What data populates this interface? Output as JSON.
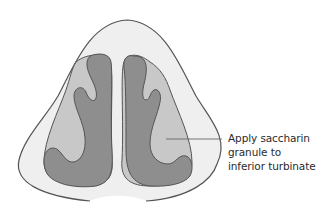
{
  "diagram": {
    "annotation": {
      "lines": [
        "Apply saccharin",
        "granule to",
        "inferior turbinate"
      ],
      "target": "inferior turbinate"
    },
    "colors": {
      "background": "#ffffff",
      "nose_fill": "#efefef",
      "outline": "#555555",
      "cavity_fill": "#c8c8c8",
      "turbinate_fill": "#8e8e8e",
      "leader_line": "#666666",
      "text": "#2b2b2b"
    }
  }
}
